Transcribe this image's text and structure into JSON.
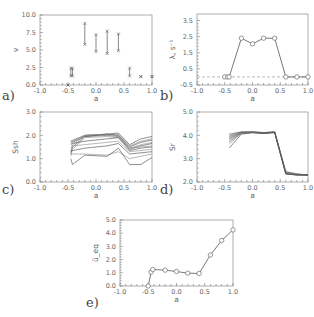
{
  "chart_data": [
    {
      "id": "a",
      "panel_label": "a)",
      "type": "scatter",
      "subtype": "range-bars",
      "xlabel": "a",
      "ylabel": "ν",
      "xlim": [
        -1.0,
        1.0
      ],
      "ylim": [
        0.0,
        10.0
      ],
      "xticks": [
        "-1.0",
        "-0.5",
        "0.0",
        "0.5",
        "1.0"
      ],
      "yticks": [
        "0.0",
        "2.5",
        "5.0",
        "7.5",
        "10.0"
      ],
      "ytick_values": [
        0.0,
        2.5,
        5.0,
        7.5,
        10.0
      ],
      "ranges": [
        {
          "x": -0.5,
          "low": 0.0,
          "high": 0.0
        },
        {
          "x": -0.45,
          "low": 1.3,
          "high": 2.4
        },
        {
          "x": -0.42,
          "low": 1.3,
          "high": 2.4
        },
        {
          "x": -0.2,
          "low": 5.8,
          "high": 8.8
        },
        {
          "x": 0.0,
          "low": 4.8,
          "high": 7.2
        },
        {
          "x": 0.2,
          "low": 4.5,
          "high": 7.7
        },
        {
          "x": 0.4,
          "low": 4.9,
          "high": 7.3
        },
        {
          "x": 0.6,
          "low": 1.3,
          "high": 2.4
        },
        {
          "x": 0.8,
          "low": 1.2,
          "high": 1.2
        },
        {
          "x": 1.0,
          "low": 1.2,
          "high": 1.2
        }
      ],
      "box": {
        "x0": 40,
        "x1": 152,
        "y0": 15,
        "y1": 85
      }
    },
    {
      "id": "b",
      "panel_label": "b)",
      "type": "line",
      "xlabel": "a",
      "ylabel": "λ, s⁻¹",
      "xlim": [
        -1.0,
        1.0
      ],
      "ylim": [
        -0.5,
        3.9
      ],
      "xticks": [
        "-1.0",
        "-0.5",
        "0.0",
        "0.5",
        "1.0"
      ],
      "yticks": [
        "-0.5",
        "0.5",
        "1.5",
        "2.5",
        "3.5"
      ],
      "ytick_values": [
        -0.5,
        0.5,
        1.5,
        2.5,
        3.5
      ],
      "reference_line": {
        "y": 0.0,
        "style": "dashed"
      },
      "x": [
        -0.5,
        -0.45,
        -0.42,
        -0.2,
        0.0,
        0.2,
        0.4,
        0.6,
        0.8,
        1.0
      ],
      "values": [
        0.0,
        0.0,
        0.0,
        2.4,
        2.05,
        2.4,
        2.4,
        0.0,
        0.0,
        0.0
      ],
      "box": {
        "x0": 197,
        "x1": 308,
        "y0": 14,
        "y1": 85
      }
    },
    {
      "id": "c",
      "panel_label": "c)",
      "type": "line",
      "xlabel": "a",
      "ylabel": "Ssh",
      "xlim": [
        -1.0,
        1.0
      ],
      "ylim": [
        0.0,
        3.0
      ],
      "xticks": [
        "-1.0",
        "-0.5",
        "0.0",
        "0.5",
        "1.0"
      ],
      "yticks": [
        "0.0",
        "1.0",
        "2.0",
        "3.0"
      ],
      "ytick_values": [
        0.0,
        1.0,
        2.0,
        3.0
      ],
      "x": [
        -0.45,
        -0.42,
        -0.2,
        0.2,
        0.4,
        0.6,
        0.8,
        1.0
      ],
      "series": [
        {
          "values": [
            1.75,
            1.75,
            2.0,
            2.05,
            2.1,
            1.6,
            1.85,
            1.95
          ]
        },
        {
          "values": [
            1.7,
            1.8,
            2.0,
            2.05,
            2.05,
            1.55,
            1.75,
            1.85
          ]
        },
        {
          "values": [
            1.65,
            1.7,
            1.95,
            2.05,
            2.0,
            1.5,
            1.7,
            1.8
          ]
        },
        {
          "values": [
            1.3,
            1.6,
            2.0,
            2.05,
            2.0,
            1.45,
            1.6,
            1.7
          ]
        },
        {
          "values": [
            1.2,
            1.5,
            1.95,
            2.0,
            1.95,
            1.4,
            1.55,
            1.65
          ]
        },
        {
          "values": [
            1.1,
            1.4,
            1.9,
            1.95,
            1.9,
            1.45,
            1.5,
            1.55
          ]
        },
        {
          "values": [
            1.6,
            1.65,
            1.75,
            1.85,
            1.9,
            1.35,
            1.45,
            1.5
          ]
        },
        {
          "values": [
            1.5,
            1.55,
            1.6,
            1.7,
            1.75,
            1.3,
            1.35,
            1.4
          ]
        },
        {
          "values": [
            1.3,
            1.35,
            1.45,
            1.55,
            1.65,
            1.2,
            1.25,
            1.3
          ]
        },
        {
          "values": [
            1.2,
            1.2,
            1.2,
            1.15,
            1.3,
            1.0,
            1.1,
            1.2
          ]
        },
        {
          "values": [
            1.0,
            0.75,
            1.15,
            1.1,
            1.45,
            0.75,
            0.75,
            1.05
          ]
        }
      ],
      "box": {
        "x0": 40,
        "x1": 152,
        "y0": 112,
        "y1": 182
      }
    },
    {
      "id": "d",
      "panel_label": "d)",
      "type": "line",
      "xlabel": "a",
      "ylabel": "Sr",
      "xlim": [
        -1.0,
        1.0
      ],
      "ylim": [
        2.0,
        5.0
      ],
      "xticks": [
        "-1.0",
        "-0.5",
        "0.0",
        "0.5",
        "1.0"
      ],
      "yticks": [
        "2.0",
        "3.0",
        "4.0",
        "5.0"
      ],
      "ytick_values": [
        2.0,
        3.0,
        4.0,
        5.0
      ],
      "x": [
        -0.42,
        -0.2,
        0.0,
        0.2,
        0.4,
        0.6,
        0.8,
        1.0
      ],
      "series": [
        {
          "values": [
            4.05,
            4.15,
            4.15,
            4.12,
            4.15,
            2.45,
            2.35,
            2.3
          ]
        },
        {
          "values": [
            4.0,
            4.14,
            4.15,
            4.12,
            4.15,
            2.42,
            2.34,
            2.3
          ]
        },
        {
          "values": [
            3.95,
            4.13,
            4.14,
            4.11,
            4.14,
            2.4,
            2.33,
            2.3
          ]
        },
        {
          "values": [
            3.9,
            4.12,
            4.14,
            4.1,
            4.14,
            2.38,
            2.32,
            2.3
          ]
        },
        {
          "values": [
            3.85,
            4.11,
            4.13,
            4.1,
            4.13,
            2.37,
            2.31,
            2.3
          ]
        },
        {
          "values": [
            3.8,
            4.1,
            4.13,
            4.09,
            4.13,
            2.36,
            2.31,
            2.3
          ]
        },
        {
          "values": [
            3.72,
            4.09,
            4.12,
            4.09,
            4.12,
            2.35,
            2.3,
            2.3
          ]
        },
        {
          "values": [
            3.62,
            4.08,
            4.12,
            4.08,
            4.12,
            2.35,
            2.3,
            2.3
          ]
        },
        {
          "values": [
            3.45,
            4.05,
            4.11,
            4.08,
            4.12,
            2.34,
            2.3,
            2.3
          ]
        }
      ],
      "box": {
        "x0": 197,
        "x1": 308,
        "y0": 112,
        "y1": 182
      }
    },
    {
      "id": "e",
      "panel_label": "e)",
      "type": "line",
      "xlabel": "a",
      "ylabel": "ū_eq",
      "xlim": [
        -1.0,
        1.0
      ],
      "ylim": [
        0.0,
        5.0
      ],
      "xticks": [
        "-1.0",
        "-0.5",
        "0.0",
        "0.5",
        "1.0"
      ],
      "yticks": [
        "0.0",
        "1.0",
        "2.0",
        "3.0",
        "4.0",
        "5.0"
      ],
      "ytick_values": [
        0.0,
        1.0,
        2.0,
        3.0,
        4.0,
        5.0
      ],
      "x": [
        -0.5,
        -0.45,
        -0.42,
        -0.2,
        0.0,
        0.2,
        0.4,
        0.6,
        0.8,
        1.0
      ],
      "values": [
        0.0,
        1.05,
        1.25,
        1.2,
        1.1,
        0.97,
        0.95,
        2.35,
        3.45,
        4.25
      ],
      "box": {
        "x0": 120,
        "x1": 233,
        "y0": 220,
        "y1": 286
      }
    }
  ]
}
